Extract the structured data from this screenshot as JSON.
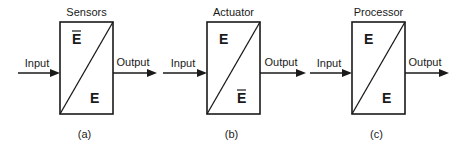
{
  "diagram": {
    "blocks": [
      {
        "id": "a",
        "title": "Sensors",
        "caption": "(a)",
        "input_label": "Input",
        "output_label": "Output",
        "upper_symbol": "E",
        "upper_overbar": true,
        "lower_symbol": "E",
        "lower_overbar": false
      },
      {
        "id": "b",
        "title": "Actuator",
        "caption": "(b)",
        "input_label": "Input",
        "output_label": "Output",
        "upper_symbol": "E",
        "upper_overbar": false,
        "lower_symbol": "E",
        "lower_overbar": true
      },
      {
        "id": "c",
        "title": "Processor",
        "caption": "(c)",
        "input_label": "Input",
        "output_label": "Output",
        "upper_symbol": "E",
        "upper_overbar": false,
        "lower_symbol": "E",
        "lower_overbar": false
      }
    ],
    "colors": {
      "stroke": "#1a1a1a",
      "background": "#ffffff"
    }
  }
}
